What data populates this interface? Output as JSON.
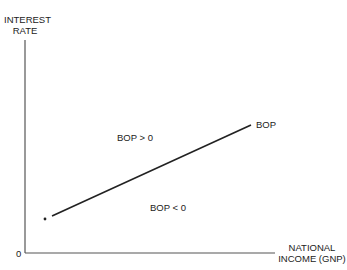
{
  "diagram": {
    "type": "economics-line-diagram",
    "y_axis": {
      "label_line1": "INTEREST",
      "label_line2": "RATE"
    },
    "x_axis": {
      "label_line1": "NATIONAL",
      "label_line2": "INCOME (GNP)"
    },
    "origin_label": "0",
    "curve": {
      "label": "BOP",
      "description": "upward-sloping balance of payments equilibrium line"
    },
    "regions": {
      "above": "BOP > 0",
      "below": "BOP < 0"
    },
    "colors": {
      "line": "#222222",
      "text": "#222222",
      "background": "#ffffff"
    }
  }
}
